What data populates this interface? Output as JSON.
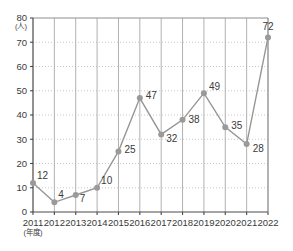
{
  "chart_data": {
    "type": "line",
    "title": "",
    "xlabel": "(年度)",
    "ylabel": "(人)",
    "categories": [
      "2011",
      "2012",
      "2013",
      "2014",
      "2015",
      "2016",
      "2017",
      "2018",
      "2019",
      "2020",
      "2021",
      "2022"
    ],
    "values": [
      12,
      4,
      7,
      10,
      25,
      47,
      32,
      38,
      49,
      35,
      28,
      72
    ],
    "series": [
      {
        "name": "",
        "values": [
          12,
          4,
          7,
          10,
          25,
          47,
          32,
          38,
          49,
          35,
          28,
          72
        ]
      }
    ],
    "yticks": [
      0,
      10,
      20,
      30,
      40,
      50,
      60,
      70,
      80
    ],
    "ylim": [
      0,
      80
    ],
    "grid": "both",
    "legend": "none",
    "data_labels": [
      "12",
      "4",
      "7",
      "10",
      "25",
      "47",
      "32",
      "38",
      "49",
      "35",
      "28",
      "72"
    ],
    "colors": {
      "line": "#969696",
      "marker": "#9a9a9a",
      "axis": "#4a4a4a",
      "vgrid": "#a8a8a8",
      "hgrid": "#bbbbbb",
      "text": "#3a3a3a",
      "background": "#ffffff"
    },
    "label_offsets": [
      {
        "dx": 4,
        "dy": -4,
        "anchor": "start"
      },
      {
        "dx": 4,
        "dy": -4,
        "anchor": "start"
      },
      {
        "dx": 4,
        "dy": 7,
        "anchor": "start"
      },
      {
        "dx": 4,
        "dy": -4,
        "anchor": "start"
      },
      {
        "dx": 6,
        "dy": 2,
        "anchor": "start"
      },
      {
        "dx": 6,
        "dy": 1,
        "anchor": "start"
      },
      {
        "dx": 5,
        "dy": 8,
        "anchor": "start"
      },
      {
        "dx": 6,
        "dy": 3,
        "anchor": "start"
      },
      {
        "dx": 5,
        "dy": -3,
        "anchor": "start"
      },
      {
        "dx": 6,
        "dy": 2,
        "anchor": "start"
      },
      {
        "dx": 6,
        "dy": 8,
        "anchor": "start"
      },
      {
        "dx": 0,
        "dy": -7,
        "anchor": "middle"
      }
    ]
  }
}
